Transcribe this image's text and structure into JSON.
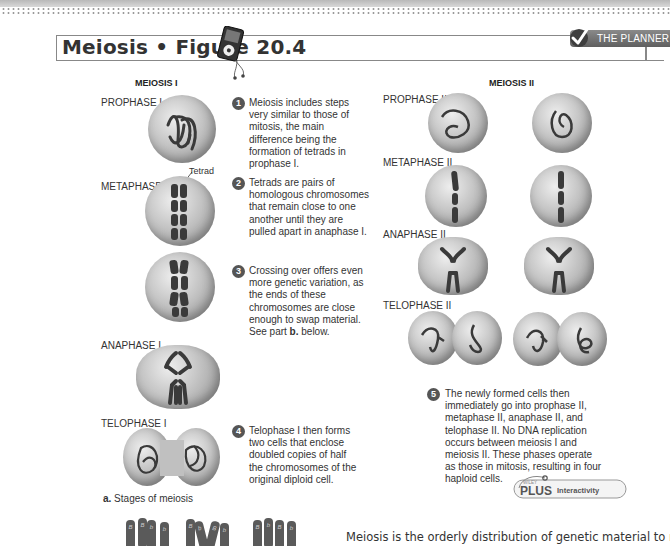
{
  "header": {
    "title": "Meiosis • Figure 20.4",
    "planner_label": "THE PLANNER",
    "icons": [
      "ipod-audio-icon",
      "checkmark-icon"
    ]
  },
  "meiosis_1": {
    "heading": "MEIOSIS I",
    "stages": [
      {
        "label": "PROPHASE I"
      },
      {
        "label": "METAPHASE I",
        "annotation": "Tetrad"
      },
      {
        "label": ""
      },
      {
        "label": "ANAPHASE I"
      },
      {
        "label": "TELOPHASE I"
      }
    ],
    "caption_letter": "a.",
    "caption_text": " Stages of meiosis"
  },
  "meiosis_2": {
    "heading": "MEIOSIS II",
    "stages": [
      {
        "label": "PROPHASE II"
      },
      {
        "label": "METAPHASE II"
      },
      {
        "label": "ANAPHASE II"
      },
      {
        "label": "TELOPHASE II"
      }
    ]
  },
  "steps": [
    {
      "number": "1",
      "text": "Meiosis includes steps very similar to those of mitosis, the main difference being the formation of tetrads in prophase I."
    },
    {
      "number": "2",
      "text": "Tetrads are pairs of homologous chromosomes that remain close to one another until they are pulled apart in anaphase I."
    },
    {
      "number": "3",
      "text_before": "Crossing over offers even more genetic variation, as the ends of these chromosomes are close enough to swap material. See part ",
      "text_bold": "b.",
      "text_after": " below."
    },
    {
      "number": "4",
      "text": "Telophase I then forms two cells that enclose doubled copies of half the chromosomes of the original diploid cell."
    },
    {
      "number": "5",
      "text": "The newly formed cells then immediately go into prophase II, metaphase II, anaphase II, and telophase II. No DNA replication occurs between meiosis I and meiosis II. These phases operate as those in mitosis, resulting in four haploid cells."
    }
  ],
  "wileyplus": {
    "brand_small": "WILEY",
    "brand": "PLUS",
    "label": "Interactivity"
  },
  "body_text": "Meiosis is the orderly distribution of genetic material to newly",
  "chromosome_labels": {
    "group1": [
      [
        "B",
        "A"
      ],
      [
        "B",
        "A"
      ],
      [
        "b",
        "a"
      ],
      [
        "b",
        "a"
      ]
    ],
    "group2": [
      [
        "B",
        "A"
      ],
      [
        "b",
        "a"
      ],
      [
        "B",
        "A"
      ],
      [
        "b",
        "a"
      ]
    ],
    "group3": [
      [
        "B",
        "a"
      ],
      [
        "b",
        "A"
      ],
      [
        "B",
        "a"
      ],
      [
        "b",
        "a"
      ]
    ]
  }
}
